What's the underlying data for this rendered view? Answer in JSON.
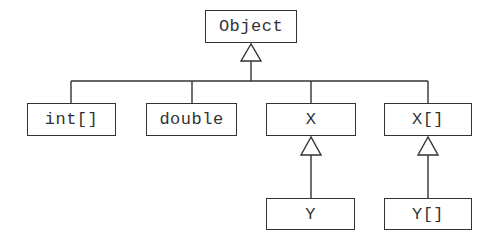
{
  "diagram": {
    "colors": {
      "stroke": "#333333",
      "text": "#333333",
      "background": "#ffffff"
    },
    "nodes": [
      {
        "id": "object",
        "label": "Object",
        "x": 205,
        "y": 10,
        "w": 92,
        "h": 33
      },
      {
        "id": "int-array",
        "label": "int[]",
        "x": 27,
        "y": 103,
        "w": 89,
        "h": 33
      },
      {
        "id": "double",
        "label": "double",
        "x": 146,
        "y": 103,
        "w": 91,
        "h": 33
      },
      {
        "id": "x",
        "label": "X",
        "x": 266,
        "y": 103,
        "w": 90,
        "h": 33
      },
      {
        "id": "x-array",
        "label": "X[]",
        "x": 384,
        "y": 103,
        "w": 88,
        "h": 33
      },
      {
        "id": "y",
        "label": "Y",
        "x": 266,
        "y": 198,
        "w": 89,
        "h": 32
      },
      {
        "id": "y-array",
        "label": "Y[]",
        "x": 384,
        "y": 198,
        "w": 88,
        "h": 32
      }
    ],
    "edges": [
      {
        "from": "int-array",
        "to": "object",
        "type": "inheritance"
      },
      {
        "from": "double",
        "to": "object",
        "type": "inheritance"
      },
      {
        "from": "x",
        "to": "object",
        "type": "inheritance"
      },
      {
        "from": "x-array",
        "to": "object",
        "type": "inheritance"
      },
      {
        "from": "y",
        "to": "x",
        "type": "inheritance"
      },
      {
        "from": "y-array",
        "to": "x-array",
        "type": "inheritance"
      }
    ]
  }
}
